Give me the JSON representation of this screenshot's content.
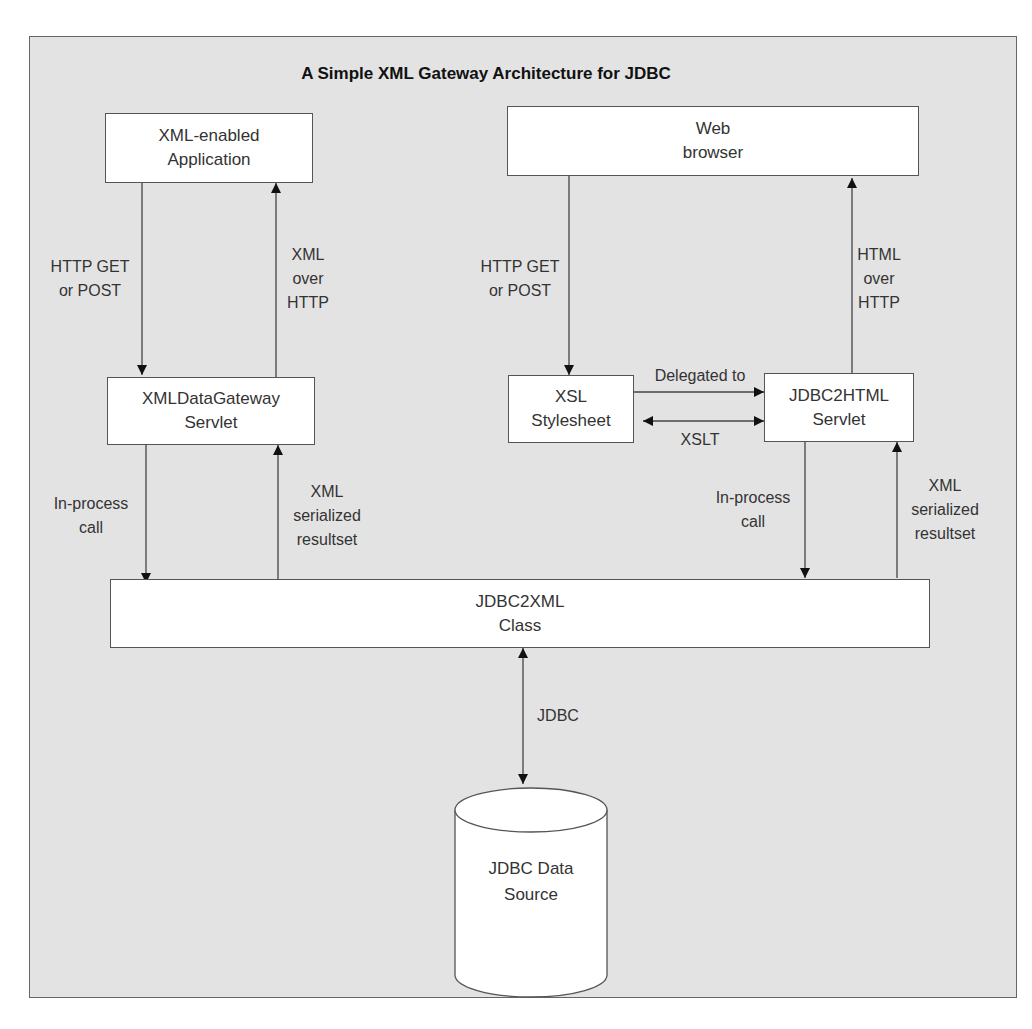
{
  "diagram": {
    "title": "A Simple XML Gateway Architecture for JDBC",
    "nodes": {
      "xml_app": {
        "line1": "XML-enabled",
        "line2": "Application"
      },
      "web_browser": {
        "line1": "Web",
        "line2": "browser"
      },
      "xml_gateway": {
        "line1": "XMLDataGateway",
        "line2": "Servlet"
      },
      "xsl_stylesheet": {
        "line1": "XSL",
        "line2": "Stylesheet"
      },
      "jdbc2html": {
        "line1": "JDBC2HTML",
        "line2": "Servlet"
      },
      "jdbc2xml": {
        "line1": "JDBC2XML",
        "line2": "Class"
      },
      "data_source": {
        "line1": "JDBC Data",
        "line2": "Source"
      }
    },
    "edges": {
      "app_to_gateway": {
        "line1": "HTTP GET",
        "line2": "or POST"
      },
      "gateway_to_app": {
        "line1": "XML",
        "line2": "over",
        "line3": "HTTP"
      },
      "browser_to_xsl": {
        "line1": "HTTP GET",
        "line2": "or POST"
      },
      "html_to_browser": {
        "line1": "HTML",
        "line2": "over",
        "line3": "HTTP"
      },
      "xsl_to_html": {
        "line1": "Delegated to"
      },
      "xsl_html_xslt": {
        "line1": "XSLT"
      },
      "gateway_to_class": {
        "line1": "In-process",
        "line2": "call"
      },
      "class_to_gateway": {
        "line1": "XML",
        "line2": "serialized",
        "line3": "resultset"
      },
      "html_to_class": {
        "line1": "In-process",
        "line2": "call"
      },
      "class_to_html": {
        "line1": "XML",
        "line2": "serialized",
        "line3": "resultset"
      },
      "class_datasource": {
        "line1": "JDBC"
      }
    }
  }
}
